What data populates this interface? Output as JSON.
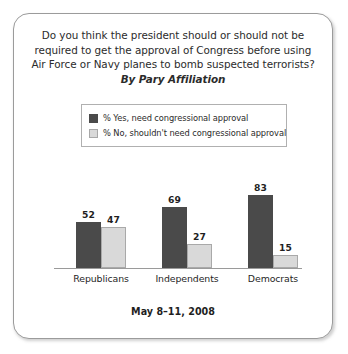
{
  "card": {
    "title_lines": [
      "Do you think the president should or should not be",
      "required to get the approval of Congress before using",
      "Air Force or Navy planes to bomb suspected terrorists?"
    ],
    "subtitle": "By Pary Affiliation",
    "footer": "May 8–11, 2008"
  },
  "legend": {
    "items": [
      {
        "label": "% Yes, need congressional approval",
        "color": "#4a4a4a",
        "swatch": "dark"
      },
      {
        "label": "% No, shouldn't need congressional approval",
        "color": "#d9d9d9",
        "swatch": "light"
      }
    ]
  },
  "chart_data": {
    "type": "bar",
    "title": "Do you think the president should or should not be required to get the approval of Congress before using Air Force or Navy planes to bomb suspected terrorists?",
    "subtitle": "By Pary Affiliation",
    "categories": [
      "Republicans",
      "Independents",
      "Democrats"
    ],
    "series": [
      {
        "name": "% Yes, need congressional approval",
        "color": "#4a4a4a",
        "values": [
          52,
          69,
          83
        ]
      },
      {
        "name": "% No, shouldn't need congressional approval",
        "color": "#d9d9d9",
        "values": [
          47,
          27,
          15
        ]
      }
    ],
    "xlabel": "",
    "ylabel": "",
    "ylim": [
      0,
      100
    ],
    "grid": false,
    "legend_position": "top",
    "annotation": "May 8–11, 2008"
  }
}
